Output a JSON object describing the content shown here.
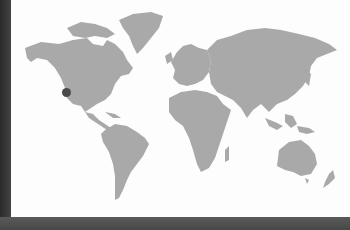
{
  "scene": {
    "description": "Photo of a printed gray world map on white paper with a single location marker",
    "paper_color": "#fdfdfd",
    "land_color": "#a9a9a9",
    "frame_color": "#3a3a3a"
  },
  "map": {
    "continents": [
      "North America",
      "Greenland",
      "South America",
      "Europe",
      "Africa",
      "Asia",
      "Australia",
      "New Zealand"
    ],
    "marker": {
      "label": "",
      "region": "California, USA",
      "x": 66,
      "y": 92,
      "size": 9,
      "color": "#4b4b4b"
    }
  }
}
